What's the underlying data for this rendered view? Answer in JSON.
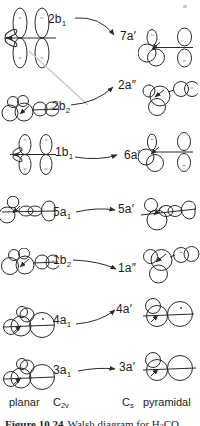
{
  "figure": {
    "type": "orbital-correlation-diagram",
    "rows": [
      {
        "left_base": "2b",
        "left_sub": "1",
        "right_label": "7a′"
      },
      {
        "left_base": "2b",
        "left_sub": "2",
        "right_label": "2a″"
      },
      {
        "left_base": "1b",
        "left_sub": "1",
        "right_label": "6a′"
      },
      {
        "left_base": "5a",
        "left_sub": "1",
        "right_label": "5a′"
      },
      {
        "left_base": "1b",
        "left_sub": "2",
        "right_label": "1a″"
      },
      {
        "left_base": "4a",
        "left_sub": "1",
        "right_label": "4a′"
      },
      {
        "left_base": "3a",
        "left_sub": "1",
        "right_label": "3a′"
      }
    ],
    "footer": {
      "left_geometry": "planar",
      "left_group_base": "C",
      "left_group_sub": "2v",
      "right_group_base": "C",
      "right_group_sub": "s",
      "right_geometry": "pyramidal"
    },
    "caption": {
      "figure_label": "Figure 10.24",
      "text_before_formula": "Walsh diagram for H",
      "formula_sub": "2",
      "formula_end": "CO"
    },
    "colors": {
      "ink": "#2a2a2a",
      "faint_line": "#c6c6c6",
      "background": "#ffffff"
    }
  }
}
